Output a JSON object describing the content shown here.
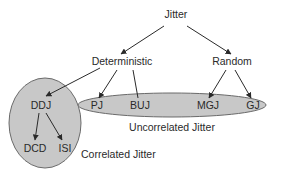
{
  "diagram": {
    "root": "Jitter",
    "level1": {
      "deterministic": "Deterministic",
      "random": "Random"
    },
    "level2": {
      "ddj": "DDJ",
      "pj": "PJ",
      "buj": "BUJ",
      "mgj": "MGJ",
      "gj": "GJ"
    },
    "level3": {
      "dcd": "DCD",
      "isi": "ISI"
    },
    "groups": {
      "uncorrelated": "Uncorrelated Jitter",
      "correlated": "Correlated Jitter"
    },
    "colors": {
      "ellipse_fill": "#c8c8c8",
      "ellipse_stroke": "#6a6a6a",
      "arrow": "#2a2a2a",
      "text": "#2a2a2a"
    }
  }
}
